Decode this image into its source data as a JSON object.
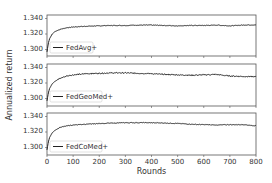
{
  "chart_data": [
    {
      "type": "line",
      "title": "",
      "legend": "FedAvg+",
      "legend_position": "lower left",
      "xlabel": "",
      "ylabel": "Annualized return",
      "xlim": [
        0,
        800
      ],
      "ylim": [
        1.295,
        1.34
      ],
      "yticks": [
        "1.300",
        "1.320",
        "1.340"
      ],
      "xticks": [
        0,
        100,
        200,
        300,
        400,
        500,
        600,
        700,
        800
      ],
      "x": [
        0,
        5,
        10,
        20,
        30,
        50,
        75,
        100,
        150,
        200,
        250,
        300,
        350,
        400,
        450,
        500,
        550,
        600,
        650,
        700,
        750,
        800
      ],
      "values": [
        1.297,
        1.308,
        1.314,
        1.32,
        1.323,
        1.326,
        1.328,
        1.329,
        1.33,
        1.3305,
        1.331,
        1.331,
        1.3315,
        1.3315,
        1.331,
        1.3305,
        1.331,
        1.331,
        1.3315,
        1.3305,
        1.3315,
        1.3318
      ],
      "noise": 0.0004
    },
    {
      "type": "line",
      "title": "",
      "legend": "FedGeoMed+",
      "legend_position": "lower left",
      "xlabel": "",
      "ylabel": "Annualized return",
      "xlim": [
        0,
        800
      ],
      "ylim": [
        1.295,
        1.34
      ],
      "yticks": [
        "1.300",
        "1.320",
        "1.340"
      ],
      "xticks": [
        0,
        100,
        200,
        300,
        400,
        500,
        600,
        700,
        800
      ],
      "x": [
        0,
        5,
        10,
        20,
        30,
        50,
        75,
        100,
        150,
        200,
        250,
        300,
        350,
        400,
        450,
        500,
        550,
        600,
        650,
        700,
        750,
        800
      ],
      "values": [
        1.297,
        1.307,
        1.313,
        1.319,
        1.322,
        1.326,
        1.329,
        1.3305,
        1.332,
        1.3325,
        1.333,
        1.333,
        1.3325,
        1.332,
        1.331,
        1.3305,
        1.33,
        1.3305,
        1.331,
        1.329,
        1.3285,
        1.328
      ],
      "noise": 0.0007
    },
    {
      "type": "line",
      "title": "",
      "legend": "FedCoMed+",
      "legend_position": "lower left",
      "xlabel": "Rounds",
      "ylabel": "Annualized return",
      "xlim": [
        0,
        800
      ],
      "ylim": [
        1.295,
        1.34
      ],
      "yticks": [
        "1.300",
        "1.320",
        "1.340"
      ],
      "xticks": [
        0,
        100,
        200,
        300,
        400,
        500,
        600,
        700,
        800
      ],
      "x": [
        0,
        5,
        10,
        20,
        30,
        50,
        75,
        100,
        150,
        200,
        250,
        300,
        350,
        400,
        450,
        500,
        550,
        600,
        650,
        700,
        750,
        800
      ],
      "values": [
        1.297,
        1.307,
        1.313,
        1.319,
        1.322,
        1.326,
        1.328,
        1.329,
        1.33,
        1.331,
        1.3315,
        1.332,
        1.332,
        1.332,
        1.3315,
        1.331,
        1.33,
        1.3295,
        1.329,
        1.3295,
        1.3295,
        1.328
      ],
      "noise": 0.0004
    }
  ],
  "figure": {
    "ylabel": "Annualized return",
    "xlabel": "Rounds",
    "xtick_labels": [
      "0",
      "100",
      "200",
      "300",
      "400",
      "500",
      "600",
      "700",
      "800"
    ],
    "panels": [
      {
        "legend": "FedAvg+",
        "yticks": [
          "1.340",
          "1.320",
          "1.300"
        ]
      },
      {
        "legend": "FedGeoMed+",
        "yticks": [
          "1.340",
          "1.320",
          "1.300"
        ]
      },
      {
        "legend": "FedCoMed+",
        "yticks": [
          "1.340",
          "1.320",
          "1.300"
        ]
      }
    ]
  }
}
